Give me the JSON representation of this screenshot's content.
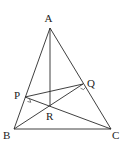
{
  "figure": {
    "type": "geometry-diagram",
    "points": {
      "A": {
        "label": "A",
        "x": 50,
        "y": 28
      },
      "B": {
        "label": "B",
        "x": 14,
        "y": 129
      },
      "C": {
        "label": "C",
        "x": 111,
        "y": 129
      },
      "P": {
        "label": "P",
        "x": 25,
        "y": 97
      },
      "Q": {
        "label": "Q",
        "x": 83,
        "y": 84
      },
      "R": {
        "label": "R",
        "x": 50,
        "y": 106
      }
    },
    "segments": [
      [
        "A",
        "B"
      ],
      [
        "A",
        "C"
      ],
      [
        "B",
        "C"
      ],
      [
        "A",
        "R"
      ],
      [
        "P",
        "Q"
      ],
      [
        "P",
        "C"
      ],
      [
        "B",
        "Q"
      ]
    ],
    "right_angle_marks": [
      "P",
      "Q"
    ]
  }
}
